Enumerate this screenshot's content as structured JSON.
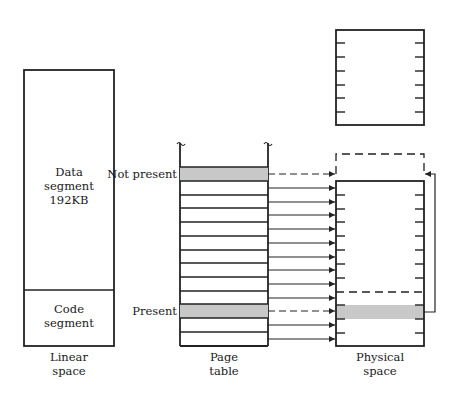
{
  "linear_space": {
    "caption_line1": "Linear",
    "caption_line2": "space",
    "data_segment": {
      "line1": "Data",
      "line2": "segment",
      "line3": "192KB"
    },
    "code_segment": {
      "line1": "Code",
      "line2": "segment"
    }
  },
  "page_table": {
    "caption_line1": "Page",
    "caption_line2": "table",
    "row_count": 13,
    "labels": {
      "not_present": "Not present",
      "present": "Present"
    },
    "not_present_row": 0,
    "present_row": 10,
    "shade_color": "#c8c8c8"
  },
  "physical_space": {
    "caption_line1": "Physical",
    "caption_line2": "space"
  },
  "colors": {
    "line": "#222222",
    "shade": "#c8c8c8",
    "background": "#ffffff"
  }
}
